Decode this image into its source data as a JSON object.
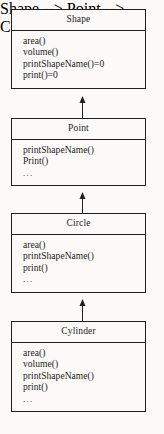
{
  "diagram": {
    "type": "uml-class-inheritance-hierarchy",
    "relationship": "generalization",
    "arrow_direction": "up",
    "colors": {
      "background": "#fbfaf8",
      "line": "#221f1d",
      "text": "#1c1a18"
    },
    "classes": [
      {
        "name": "Shape",
        "members": [
          "area()",
          "volume()",
          "printShapeName()=0",
          "print()=0"
        ]
      },
      {
        "name": "Point",
        "members": [
          "printShapeName()",
          "Print()",
          "..."
        ]
      },
      {
        "name": "Circle",
        "members": [
          "area()",
          "printShapeName()",
          "print()",
          "..."
        ]
      },
      {
        "name": "Cylinder",
        "members": [
          "area()",
          "volume()",
          "printShapeName()",
          "print()",
          "..."
        ]
      }
    ],
    "connectors": [
      {
        "from": "Point",
        "to": "Shape"
      },
      {
        "from": "Circle",
        "to": "Point"
      },
      {
        "from": "Cylinder",
        "to": "Circle"
      }
    ]
  }
}
